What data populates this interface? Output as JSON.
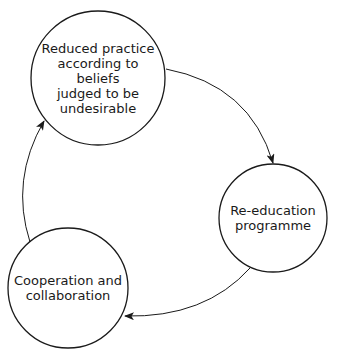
{
  "diagram": {
    "type": "cycle",
    "nodes": [
      {
        "id": "reduced-practice",
        "label": "Reduced practice according to beliefs judged to be undesirable",
        "lines": [
          "Reduced practice",
          "according to beliefs",
          "judged to be",
          "undesirable"
        ]
      },
      {
        "id": "re-education",
        "label": "Re-education programme",
        "lines": [
          "Re-education",
          "programme"
        ]
      },
      {
        "id": "cooperation",
        "label": "Cooperation and collaboration",
        "lines": [
          "Cooperation and",
          "collaboration"
        ]
      }
    ],
    "edges": [
      {
        "from": "reduced-practice",
        "to": "re-education"
      },
      {
        "from": "re-education",
        "to": "cooperation"
      },
      {
        "from": "cooperation",
        "to": "reduced-practice"
      }
    ],
    "colors": {
      "stroke": "#1a1a1a",
      "fill": "#ffffff"
    }
  }
}
